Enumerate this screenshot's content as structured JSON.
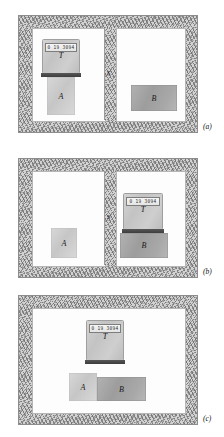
{
  "figure": {
    "kind": "thermodynamics-diagram",
    "wall_color": "#d2d2d2",
    "chamber_color": "#fdfdfd",
    "block_light_color": "#d0d0d0",
    "block_dark_color": "#a6a6a6"
  },
  "panels": [
    {
      "caption": "(a)",
      "divider_label": "S",
      "thermoscope": {
        "display": "0 19 3094",
        "label": "T"
      },
      "blocks": [
        {
          "label": "A",
          "shade": "light"
        },
        {
          "label": "B",
          "shade": "dark"
        }
      ]
    },
    {
      "caption": "(b)",
      "divider_label": "S",
      "thermoscope": {
        "display": "0 19 3094",
        "label": "T"
      },
      "blocks": [
        {
          "label": "A",
          "shade": "light"
        },
        {
          "label": "B",
          "shade": "dark"
        }
      ]
    },
    {
      "caption": "(c)",
      "divider_label": "",
      "thermoscope": {
        "display": "0 19 3094",
        "label": "T"
      },
      "blocks": [
        {
          "label": "A",
          "shade": "light"
        },
        {
          "label": "B",
          "shade": "dark"
        }
      ]
    }
  ]
}
